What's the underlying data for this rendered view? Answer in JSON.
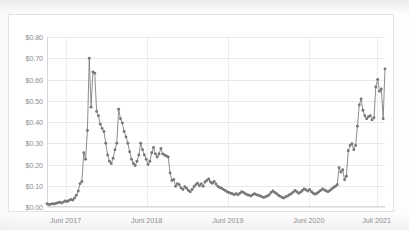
{
  "chart_data": {
    "type": "line",
    "title": "",
    "xlabel": "",
    "ylabel": "",
    "ylim": [
      0.0,
      0.8
    ],
    "ytick_values": [
      0.8,
      0.7,
      0.6,
      0.5,
      0.4,
      0.3,
      0.2,
      0.1,
      0.0
    ],
    "ytick_labels": [
      "$0.80",
      "$0.70",
      "$0.60",
      "$0.50",
      "$0.40",
      "$0.30",
      "$0.20",
      "$0.10",
      "$0.00"
    ],
    "xtick_labels": [
      "Juni 2017",
      "Juni 2018",
      "Juni 2019",
      "Juni 2020",
      "Juli 2021"
    ],
    "xtick_positions": [
      0.055,
      0.295,
      0.535,
      0.775,
      0.975
    ],
    "grid": true,
    "legend": null,
    "marker": "circle",
    "line_color": "#808085",
    "marker_color": "#77777c",
    "series": [
      {
        "name": "price",
        "values": [
          0.015,
          0.012,
          0.013,
          0.016,
          0.014,
          0.018,
          0.02,
          0.022,
          0.019,
          0.024,
          0.028,
          0.026,
          0.031,
          0.035,
          0.033,
          0.042,
          0.055,
          0.075,
          0.11,
          0.12,
          0.255,
          0.225,
          0.36,
          0.7,
          0.47,
          0.635,
          0.63,
          0.45,
          0.43,
          0.39,
          0.37,
          0.355,
          0.3,
          0.245,
          0.215,
          0.205,
          0.23,
          0.27,
          0.3,
          0.46,
          0.415,
          0.395,
          0.355,
          0.33,
          0.3,
          0.26,
          0.225,
          0.205,
          0.195,
          0.215,
          0.245,
          0.3,
          0.27,
          0.245,
          0.225,
          0.2,
          0.215,
          0.255,
          0.28,
          0.25,
          0.235,
          0.25,
          0.275,
          0.25,
          0.245,
          0.24,
          0.235,
          0.16,
          0.125,
          0.13,
          0.098,
          0.11,
          0.105,
          0.09,
          0.082,
          0.095,
          0.088,
          0.078,
          0.072,
          0.082,
          0.095,
          0.105,
          0.112,
          0.1,
          0.108,
          0.098,
          0.118,
          0.125,
          0.132,
          0.118,
          0.112,
          0.12,
          0.108,
          0.098,
          0.092,
          0.088,
          0.082,
          0.078,
          0.072,
          0.068,
          0.065,
          0.062,
          0.058,
          0.062,
          0.058,
          0.065,
          0.072,
          0.068,
          0.062,
          0.058,
          0.055,
          0.052,
          0.058,
          0.062,
          0.058,
          0.055,
          0.052,
          0.048,
          0.045,
          0.048,
          0.052,
          0.058,
          0.068,
          0.075,
          0.068,
          0.062,
          0.055,
          0.05,
          0.045,
          0.042,
          0.048,
          0.052,
          0.058,
          0.062,
          0.07,
          0.078,
          0.072,
          0.065,
          0.07,
          0.078,
          0.085,
          0.08,
          0.075,
          0.082,
          0.072,
          0.065,
          0.06,
          0.065,
          0.072,
          0.078,
          0.085,
          0.08,
          0.075,
          0.072,
          0.078,
          0.085,
          0.092,
          0.098,
          0.105,
          0.185,
          0.165,
          0.175,
          0.128,
          0.145,
          0.265,
          0.29,
          0.298,
          0.27,
          0.29,
          0.38,
          0.48,
          0.508,
          0.455,
          0.43,
          0.415,
          0.425,
          0.43,
          0.41,
          0.42,
          0.565,
          0.6,
          0.545,
          0.555,
          0.415,
          0.65
        ]
      }
    ]
  },
  "axes": {
    "y_title": "",
    "x_title": ""
  }
}
